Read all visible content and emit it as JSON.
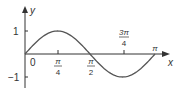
{
  "chart_data": {
    "type": "line",
    "title": "",
    "xlabel": "x",
    "ylabel": "y",
    "function": "y = sin 2x",
    "x": [
      0,
      0.3927,
      0.7854,
      1.1781,
      1.5708,
      1.9635,
      2.3562,
      2.7489,
      3.1416
    ],
    "series": [
      {
        "name": "sin 2x",
        "values": [
          0,
          0.707,
          1,
          0.707,
          0,
          -0.707,
          -1,
          -0.707,
          0
        ]
      }
    ],
    "x_ticks": [
      {
        "num": "π",
        "den": "4"
      },
      {
        "num": "π",
        "den": "2"
      },
      {
        "num": "3π",
        "den": "4"
      },
      {
        "num": "π",
        "den": ""
      }
    ],
    "y_ticks": [
      "1",
      "−1"
    ],
    "origin_label": "0",
    "xlim": [
      0,
      3.3
    ],
    "ylim": [
      -1.3,
      1.5
    ],
    "grid": false,
    "legend": "none"
  }
}
